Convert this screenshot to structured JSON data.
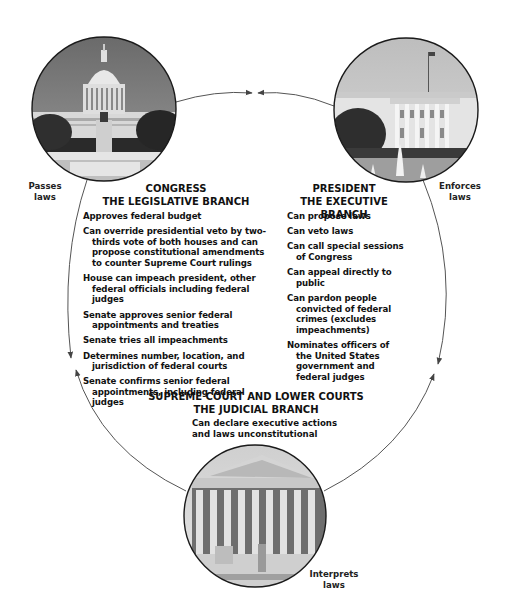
{
  "diagram": {
    "arrow_color": "#555555",
    "circle_border_color": "#1a1a1a"
  },
  "legislative": {
    "photo_label": "U.S. Capitol building",
    "side_label_line1": "Passes",
    "side_label_line2": "laws",
    "heading_line1": "CONGRESS",
    "heading_line2": "THE LEGISLATIVE BRANCH",
    "powers": [
      "Approves federal budget",
      "Can override presidential veto by two-thirds vote of both houses and can propose constitutional amendments to counter Supreme Court rulings",
      "House can impeach president, other federal officials including federal judges",
      "Senate approves senior federal appointments and treaties",
      "Senate tries all impeachments",
      "Determines number, location, and jurisdiction of federal courts",
      "Senate confirms senior federal appointments, including federal judges"
    ]
  },
  "executive": {
    "photo_label": "White House",
    "side_label_line1": "Enforces",
    "side_label_line2": "laws",
    "heading_line1": "PRESIDENT",
    "heading_line2": "THE EXECUTIVE BRANCH",
    "powers": [
      "Can propose laws",
      "Can veto laws",
      "Can call special sessions of Congress",
      "Can appeal directly to public",
      "Can pardon people convicted of federal crimes (excludes impeachments)",
      "Nominates officers of the United States government and federal judges"
    ]
  },
  "judicial": {
    "photo_label": "Supreme Court building",
    "side_label_line1": "Interprets",
    "side_label_line2": "laws",
    "heading_line1": "SUPREME COURT AND LOWER COURTS",
    "heading_line2": "THE JUDICIAL BRANCH",
    "power_line1": "Can declare executive actions",
    "power_line2": "and laws unconstitutional"
  }
}
